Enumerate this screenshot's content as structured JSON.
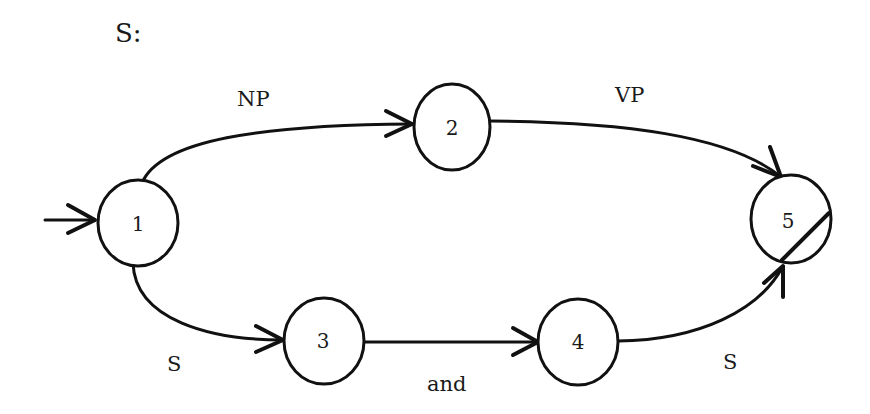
{
  "diagram": {
    "title": "S:",
    "type": "augmented transition network",
    "nodes": [
      {
        "id": "1",
        "label": "1",
        "initial": true,
        "final": false
      },
      {
        "id": "2",
        "label": "2",
        "initial": false,
        "final": false
      },
      {
        "id": "3",
        "label": "3",
        "initial": false,
        "final": false
      },
      {
        "id": "4",
        "label": "4",
        "initial": false,
        "final": false
      },
      {
        "id": "5",
        "label": "5",
        "initial": false,
        "final": true
      }
    ],
    "edges": [
      {
        "from": "1",
        "to": "2",
        "label": "NP"
      },
      {
        "from": "2",
        "to": "5",
        "label": "VP"
      },
      {
        "from": "1",
        "to": "3",
        "label": "S"
      },
      {
        "from": "3",
        "to": "4",
        "label": "and"
      },
      {
        "from": "4",
        "to": "5",
        "label": "S"
      }
    ]
  }
}
